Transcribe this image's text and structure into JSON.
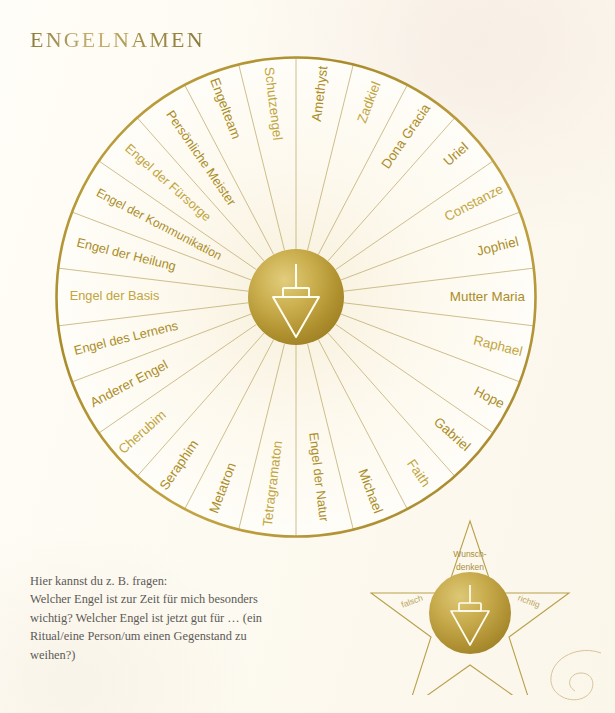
{
  "page": {
    "title": "ENGELNAMEN",
    "background_color": "#fdfaf1",
    "gold_color": "#b59432",
    "gold_text_color": "#b8982f",
    "dark_gold_text_color": "#8e7426",
    "body_text_color": "#5c5a57"
  },
  "wheel": {
    "name": "angel-names-divination-wheel",
    "center_x": 296,
    "center_y": 297,
    "radius": 240,
    "hub_radius": 48,
    "segment_count": 24,
    "hub_icon": "pendulum-icon",
    "segments": [
      {
        "index": 0,
        "label": "Amethyst"
      },
      {
        "index": 1,
        "label": "Zadkiel"
      },
      {
        "index": 2,
        "label": "Dona Gracia"
      },
      {
        "index": 3,
        "label": "Uriel"
      },
      {
        "index": 4,
        "label": "Constanze"
      },
      {
        "index": 5,
        "label": "Jophiel"
      },
      {
        "index": 6,
        "label": "Mutter Maria"
      },
      {
        "index": 7,
        "label": "Raphael"
      },
      {
        "index": 8,
        "label": "Hope"
      },
      {
        "index": 9,
        "label": "Gabriel"
      },
      {
        "index": 10,
        "label": "Faith"
      },
      {
        "index": 11,
        "label": "Michael"
      },
      {
        "index": 12,
        "label": "Engel der Natur"
      },
      {
        "index": 13,
        "label": "Tetragramaton"
      },
      {
        "index": 14,
        "label": "Metatron"
      },
      {
        "index": 15,
        "label": "Seraphim"
      },
      {
        "index": 16,
        "label": "Cherubim"
      },
      {
        "index": 17,
        "label": "Anderer Engel"
      },
      {
        "index": 18,
        "label": "Engel des Lernens"
      },
      {
        "index": 19,
        "label": "Engel der Basis"
      },
      {
        "index": 20,
        "label": "Engel der Heilung"
      },
      {
        "index": 21,
        "label": "Engel der Kommunikation"
      },
      {
        "index": 22,
        "label": "Engel der Fürsorge"
      },
      {
        "index": 23,
        "label": "Persönliche Meister"
      },
      {
        "index": 24,
        "label": "Engelteam"
      },
      {
        "index": 25,
        "label": "Schutzengel"
      }
    ]
  },
  "note": {
    "name": "instruction-paragraph",
    "lines": [
      "Hier kannst du z. B. fragen:",
      "Welcher Engel ist zur Zeit für mich besonders",
      "wichtig? Welcher Engel ist jetzt gut für … (ein",
      "Ritual/eine Person/um einen Gegenstand zu",
      "weihen?)"
    ]
  },
  "pendulum_star": {
    "name": "pendulum-answer-star",
    "center_x": 470,
    "center_y": 613,
    "circle_radius": 41,
    "hub_icon": "pendulum-icon",
    "labels": {
      "top_line1": "Wunsch-",
      "top_line2": "denken",
      "left": "falsch",
      "right": "richtig"
    }
  },
  "flourish": {
    "name": "corner-flourish-ornament"
  }
}
